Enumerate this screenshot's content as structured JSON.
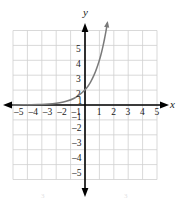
{
  "figure": {
    "axis_label_x": "x",
    "axis_label_y": "y",
    "x_tick_labels_negative": [
      "–5",
      "–4",
      "–3",
      "–2",
      "–1"
    ],
    "x_tick_labels_positive": [
      "1",
      "2",
      "3",
      "4",
      "5"
    ],
    "y_tick_labels_positive": [
      "5",
      "4",
      "3",
      "2",
      "1"
    ],
    "y_tick_labels_negative": [
      "–1",
      "–2",
      "–3",
      "–4",
      "–5"
    ],
    "colors": {
      "grid": "#cfcfcf",
      "axis": "#000000",
      "curve": "#7a7a7a",
      "text": "#1a1a1a",
      "background": "#ffffff"
    },
    "artifacts": [
      "3",
      "3"
    ]
  },
  "chart_data": {
    "type": "line",
    "title": "",
    "subtitle": "",
    "xlabel": "x",
    "ylabel": "y",
    "xlim": [
      -5,
      5
    ],
    "ylim": [
      -5,
      5
    ],
    "xticks": [
      -5,
      -4,
      -3,
      -2,
      -1,
      1,
      2,
      3,
      4,
      5
    ],
    "yticks": [
      -5,
      -4,
      -3,
      -2,
      -1,
      1,
      2,
      3,
      4,
      5
    ],
    "grid": true,
    "legend": "none",
    "series": [
      {
        "name": "y = 3^x",
        "equation": "y = 3^x",
        "style": "solid",
        "color": "#7a7a7a",
        "arrow_end": "right-up",
        "x": [
          -5.0,
          -4.5,
          -4.0,
          -3.5,
          -3.0,
          -2.5,
          -2.0,
          -1.5,
          -1.0,
          -0.5,
          0.0,
          0.25,
          0.5,
          0.75,
          1.0,
          1.1,
          1.2,
          1.3,
          1.4,
          1.5,
          1.55
        ],
        "y": [
          0.004,
          0.008,
          0.012,
          0.021,
          0.037,
          0.064,
          0.111,
          0.192,
          0.333,
          0.577,
          1.0,
          1.316,
          1.732,
          2.279,
          3.0,
          3.348,
          3.737,
          4.171,
          4.656,
          5.196,
          5.48
        ]
      }
    ],
    "annotations": [
      {
        "text": "curve passes through (0, 1)",
        "x": 0,
        "y": 1
      },
      {
        "text": "horizontal asymptote y = 0",
        "x": -5,
        "y": 0
      }
    ]
  }
}
